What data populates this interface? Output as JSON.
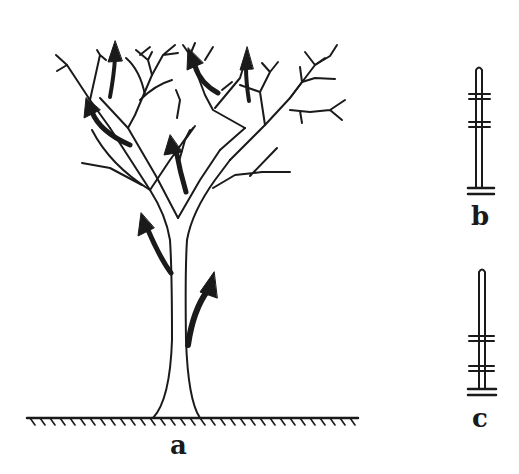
{
  "figure": {
    "panels": [
      {
        "id": "a",
        "label": "a",
        "description": "Tree with arrows showing upward growth direction of trunk and branches"
      },
      {
        "id": "b",
        "label": "b",
        "description": "Single stem with two pairs of marks near the top"
      },
      {
        "id": "c",
        "label": "c",
        "description": "Single stem with two pairs of marks near the bottom"
      }
    ],
    "colors": {
      "ink": "#1a1a1a",
      "background": "#ffffff"
    }
  }
}
